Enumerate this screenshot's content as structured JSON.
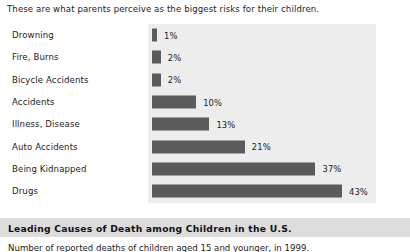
{
  "intro": {
    "text": "These are what parents perceive as the biggest risks for their children."
  },
  "colors": {
    "bar": "#5b5b5b",
    "plot_panel": "#ededed",
    "banner": "#dcdcdc",
    "page_background": "#ffffff",
    "text": "#1c1c1c"
  },
  "chart_data": {
    "type": "bar",
    "orientation": "horizontal",
    "title": "",
    "xlabel": "",
    "ylabel": "",
    "grid": false,
    "legend": false,
    "xlim": [
      0,
      43
    ],
    "value_suffix": "%",
    "categories": [
      "Drowning",
      "Fire, Burns",
      "Bicycle Accidents",
      "Accidents",
      "Illness, Disease",
      "Auto Accidents",
      "Being Kidnapped",
      "Drugs"
    ],
    "values": [
      1,
      2,
      2,
      10,
      13,
      21,
      37,
      43
    ],
    "value_labels": [
      "1%",
      "2%",
      "2%",
      "10%",
      "13%",
      "21%",
      "37%",
      "43%"
    ]
  },
  "footer": {
    "banner_title": "Leading Causes of Death among Children in the U.S.",
    "caption": "Number of reported deaths of children aged 15 and younger, in 1999."
  }
}
